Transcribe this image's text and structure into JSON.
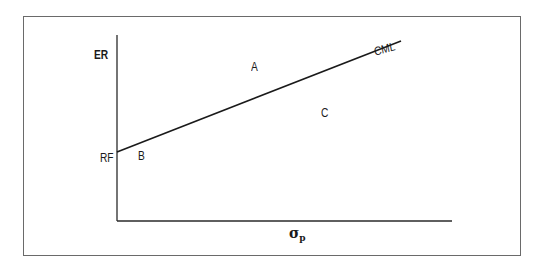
{
  "diagram": {
    "type": "capital-market-line",
    "y_axis_label": "ER",
    "x_axis_label": {
      "symbol": "σ",
      "subscript": "p"
    },
    "intercept_label": "RF",
    "line_label": "CML",
    "points": [
      {
        "label": "A",
        "position": "above line"
      },
      {
        "label": "B",
        "position": "on line near RF"
      },
      {
        "label": "C",
        "position": "below line"
      }
    ],
    "colors": {
      "line": "#1a1a1a",
      "axes": "#2a2a2a",
      "frame": "#6a6a6a",
      "text": "#1a1a1a"
    }
  }
}
